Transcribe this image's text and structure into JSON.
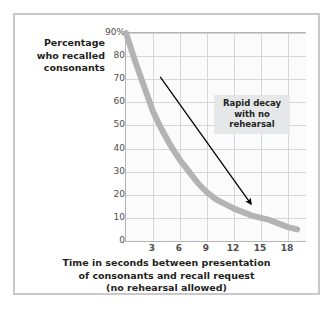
{
  "figure": {
    "y_axis_caption_lines": [
      "Percentage",
      "who recalled",
      "consonants"
    ],
    "x_axis_caption_lines": [
      "Time in seconds between presentation",
      "of consonants and recall request",
      "(no rehearsal allowed)"
    ],
    "annotation_lines": [
      "Rapid decay",
      "with no",
      "rehearsal"
    ],
    "colors": {
      "curve": "#b3b3b3",
      "grid": "#d4d6d8",
      "axis": "#b3b3b3",
      "frame": "#c9c9c9",
      "plot_background": "#fbfbfc",
      "annotation_background": "#e6e7e8",
      "arrow": "#000000",
      "text": "#231f20",
      "tick_text": "#4d4d4d"
    }
  },
  "chart_data": {
    "type": "line",
    "title": "",
    "xlabel": "Time in seconds between presentation of consonants and recall request (no rehearsal allowed)",
    "ylabel": "Percentage who recalled consonants",
    "xlim": [
      0,
      20
    ],
    "ylim": [
      0,
      90
    ],
    "grid": true,
    "legend": "none",
    "ytick_labels": [
      "90%",
      "80",
      "70",
      "60",
      "50",
      "40",
      "30",
      "20",
      "10",
      "0"
    ],
    "ytick_values": [
      90,
      80,
      70,
      60,
      50,
      40,
      30,
      20,
      10,
      0
    ],
    "xtick_labels": [
      "3",
      "6",
      "9",
      "12",
      "15",
      "18"
    ],
    "xtick_values": [
      3,
      6,
      9,
      12,
      15,
      18
    ],
    "series": [
      {
        "name": "Percentage recalled",
        "x": [
          0,
          1,
          2,
          3,
          4,
          5,
          6,
          7,
          8,
          9,
          10,
          12,
          14,
          15,
          16,
          18,
          19
        ],
        "values": [
          90,
          78,
          67,
          56,
          48,
          41,
          35,
          30,
          25,
          21,
          18,
          14,
          11,
          10,
          9,
          6,
          5
        ]
      }
    ],
    "annotations": [
      {
        "text": "Rapid decay with no rehearsal",
        "type": "text-box",
        "x": 11.5,
        "y": 62
      },
      {
        "type": "arrow",
        "from": {
          "x": 3.8,
          "y": 71
        },
        "to": {
          "x": 13.9,
          "y": 16
        }
      }
    ]
  }
}
